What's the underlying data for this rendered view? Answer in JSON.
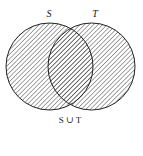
{
  "diagram": {
    "type": "venn",
    "sets": [
      {
        "name": "S",
        "label": "S",
        "cx": 49.5,
        "cy": 66.5,
        "r": 43.5
      },
      {
        "name": "T",
        "label": "T",
        "cx": 91.5,
        "cy": 66.5,
        "r": 43.5
      }
    ],
    "shaded_region": "union",
    "caption": "S ∪ T",
    "colors": {
      "stroke": "#222222",
      "hatch": "#333333",
      "background": "#ffffff"
    }
  }
}
